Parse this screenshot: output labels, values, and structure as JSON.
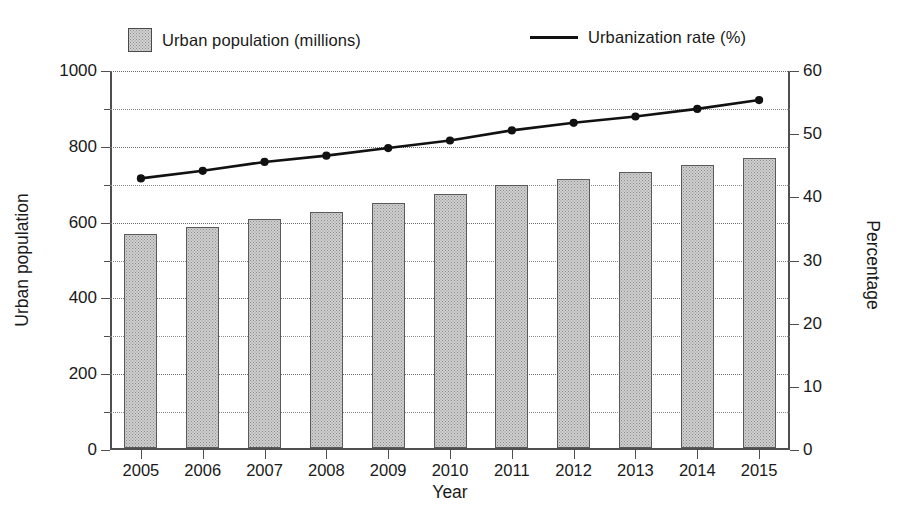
{
  "chart_data": {
    "type": "bar",
    "title": "",
    "categories": [
      "2005",
      "2006",
      "2007",
      "2008",
      "2009",
      "2010",
      "2011",
      "2012",
      "2013",
      "2014",
      "2015"
    ],
    "xlabel": "Year",
    "ylabel": "Urban population",
    "ylabel_secondary": "Percentage",
    "ylim": [
      0,
      1000
    ],
    "ylim_secondary": [
      0,
      60
    ],
    "yticks": [
      0,
      200,
      400,
      600,
      800,
      1000
    ],
    "yticks_minor": [
      100,
      300,
      500,
      700,
      900
    ],
    "yticks_secondary": [
      0,
      10,
      20,
      30,
      40,
      50,
      60
    ],
    "grid": true,
    "grid_style": "dotted-horizontal",
    "legend_position": "top",
    "series": [
      {
        "name": "Urban population (millions)",
        "type": "bar",
        "axis": "left",
        "color": "#d0d0d0",
        "edge_color": "#5a5a5a",
        "values": [
          565,
          585,
          605,
          625,
          648,
          670,
          695,
          710,
          730,
          748,
          765
        ]
      },
      {
        "name": "Urbanization rate (%)",
        "type": "line",
        "axis": "right",
        "color": "#111111",
        "marker": "filled-circle",
        "values": [
          43.0,
          44.2,
          45.6,
          46.6,
          47.8,
          49.0,
          50.6,
          51.8,
          52.8,
          54.0,
          55.4
        ]
      }
    ]
  },
  "legend": {
    "bar_label": "Urban population (millions)",
    "line_label": "Urbanization rate (%)"
  },
  "axes": {
    "x_title": "Year",
    "y_left_title": "Urban population",
    "y_right_title": "Percentage"
  }
}
